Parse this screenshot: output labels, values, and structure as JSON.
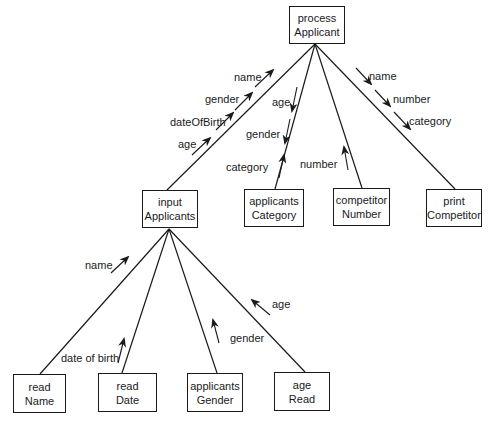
{
  "diagram": {
    "type": "structure-chart",
    "line_color": "#1a1a1a",
    "root": {
      "id": "processApplicant",
      "line1": "process",
      "line2": "Applicant",
      "box": [
        289,
        6,
        56,
        38
      ]
    },
    "level1": [
      {
        "id": "inputApplicants",
        "line1": "input",
        "line2": "Applicants",
        "box": [
          142,
          190,
          56,
          38
        ]
      },
      {
        "id": "applicantsCategory",
        "line1": "applicants",
        "line2": "Category",
        "box": [
          244,
          189,
          60,
          38
        ]
      },
      {
        "id": "competitorNumber",
        "line1": "competitor",
        "line2": "Number",
        "box": [
          333,
          188,
          57,
          38
        ]
      },
      {
        "id": "printCompetitor",
        "line1": "print",
        "line2": "Competitor",
        "box": [
          426,
          189,
          56,
          38
        ]
      }
    ],
    "level2": [
      {
        "id": "readName",
        "line1": "read",
        "line2": "Name",
        "box": [
          13,
          374,
          53,
          39
        ]
      },
      {
        "id": "readDate",
        "line1": "read",
        "line2": "Date",
        "box": [
          98,
          373,
          59,
          39
        ]
      },
      {
        "id": "applicantsGender",
        "line1": "applicants",
        "line2": "Gender",
        "box": [
          187,
          373,
          56,
          39
        ]
      },
      {
        "id": "ageRead",
        "line1": "age",
        "line2": "Read",
        "box": [
          274,
          372,
          56,
          39
        ]
      }
    ],
    "connections": [
      {
        "from": "processApplicant",
        "to": "inputApplicants",
        "x1": 315,
        "y1": 44,
        "x2": 167,
        "y2": 190
      },
      {
        "from": "processApplicant",
        "to": "applicantsCategory",
        "x1": 315,
        "y1": 44,
        "x2": 275,
        "y2": 189
      },
      {
        "from": "processApplicant",
        "to": "competitorNumber",
        "x1": 315,
        "y1": 44,
        "x2": 362,
        "y2": 188
      },
      {
        "from": "processApplicant",
        "to": "printCompetitor",
        "x1": 315,
        "y1": 44,
        "x2": 455,
        "y2": 189
      },
      {
        "from": "inputApplicants",
        "to": "readName",
        "x1": 169,
        "y1": 229,
        "x2": 40,
        "y2": 374
      },
      {
        "from": "inputApplicants",
        "to": "readDate",
        "x1": 169,
        "y1": 229,
        "x2": 122,
        "y2": 373
      },
      {
        "from": "inputApplicants",
        "to": "applicantsGender",
        "x1": 169,
        "y1": 229,
        "x2": 217,
        "y2": 373
      },
      {
        "from": "inputApplicants",
        "to": "ageRead",
        "x1": 169,
        "y1": 229,
        "x2": 305,
        "y2": 372
      }
    ],
    "data_flows": [
      {
        "label": "name",
        "lx": 234,
        "ly": 71,
        "ax1": 255,
        "ay1": 87,
        "ax2": 273,
        "ay2": 70
      },
      {
        "label": "gender",
        "lx": 205,
        "ly": 93,
        "ax1": 235,
        "ay1": 110,
        "ax2": 252,
        "ay2": 93
      },
      {
        "label": "dateOfBirth",
        "lx": 170,
        "ly": 116,
        "ax1": 216,
        "ay1": 130,
        "ax2": 233,
        "ay2": 113
      },
      {
        "label": "age",
        "lx": 178,
        "ly": 138,
        "ax1": 192,
        "ay1": 155,
        "ax2": 210,
        "ay2": 138
      },
      {
        "label": "age",
        "lx": 272,
        "ly": 96,
        "ax1": 297,
        "ay1": 87,
        "ax2": 292,
        "ay2": 111
      },
      {
        "label": "gender",
        "lx": 246,
        "ly": 128,
        "ax1": 290,
        "ay1": 119,
        "ax2": 285,
        "ay2": 143
      },
      {
        "label": "category",
        "lx": 226,
        "ly": 161,
        "ax1": 279,
        "ay1": 178,
        "ax2": 284,
        "ay2": 155
      },
      {
        "label": "number",
        "lx": 300,
        "ly": 158,
        "ax1": 348,
        "ay1": 170,
        "ax2": 344,
        "ay2": 147
      },
      {
        "label": "name",
        "lx": 369,
        "ly": 70,
        "ax1": 356,
        "ay1": 68,
        "ax2": 371,
        "ay2": 84
      },
      {
        "label": "number",
        "lx": 393,
        "ly": 93,
        "ax1": 375,
        "ay1": 90,
        "ax2": 390,
        "ay2": 106
      },
      {
        "label": "category",
        "lx": 409,
        "ly": 115,
        "ax1": 394,
        "ay1": 112,
        "ax2": 410,
        "ay2": 129
      },
      {
        "label": "name",
        "lx": 85,
        "ly": 259,
        "ax1": 111,
        "ay1": 273,
        "ax2": 128,
        "ay2": 257
      },
      {
        "label": "date of birth",
        "lx": 61,
        "ly": 352,
        "ax1": 118,
        "ay1": 363,
        "ax2": 124,
        "ay2": 339
      },
      {
        "label": "gender",
        "lx": 230,
        "ly": 332,
        "ax1": 219,
        "ay1": 343,
        "ax2": 213,
        "ay2": 320
      },
      {
        "label": "age",
        "lx": 272,
        "ly": 298,
        "ax1": 270,
        "ay1": 315,
        "ax2": 252,
        "ay2": 300
      }
    ]
  }
}
